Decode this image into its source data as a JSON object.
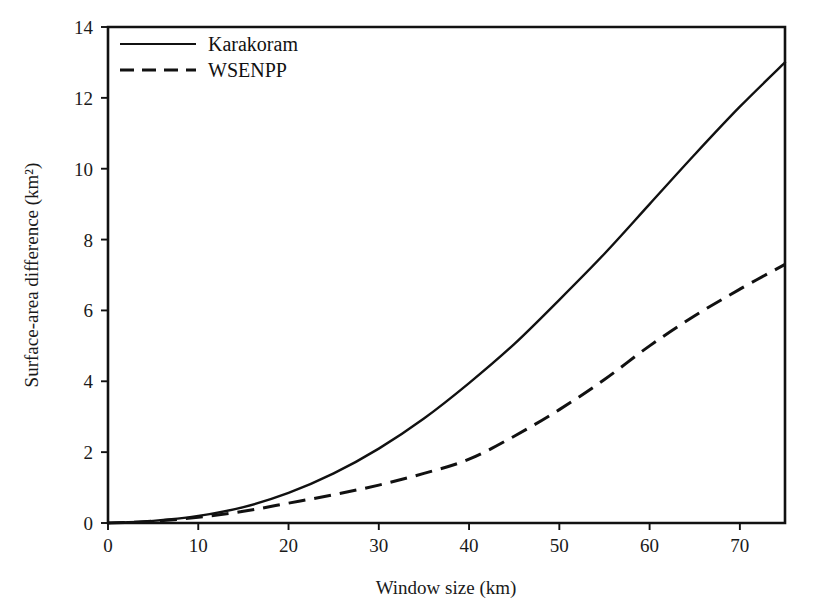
{
  "chart_data": {
    "type": "line",
    "title": "",
    "xlabel": "Window size (km)",
    "ylabel": "Surface-area difference (km²)",
    "xlim": [
      0,
      75
    ],
    "ylim": [
      0,
      14
    ],
    "xticks": [
      0,
      10,
      20,
      30,
      40,
      50,
      60,
      70
    ],
    "xtick_labels": [
      "0",
      "10",
      "20",
      "30",
      "40",
      "50",
      "60",
      "70"
    ],
    "yticks": [
      0,
      2,
      4,
      6,
      8,
      10,
      12,
      14
    ],
    "ytick_labels": [
      "0",
      "2",
      "4",
      "6",
      "8",
      "10",
      "12",
      "14"
    ],
    "grid": false,
    "legend_position": "upper left inside",
    "x": [
      0,
      5,
      10,
      15,
      20,
      25,
      30,
      35,
      40,
      45,
      50,
      55,
      60,
      65,
      70,
      75
    ],
    "series": [
      {
        "name": "Karakoram",
        "style": "solid",
        "color": "#111111",
        "values": [
          0.0,
          0.06,
          0.2,
          0.45,
          0.85,
          1.4,
          2.1,
          2.95,
          3.95,
          5.05,
          6.3,
          7.6,
          9.0,
          10.4,
          11.75,
          13.0
        ]
      },
      {
        "name": "WSENPP",
        "style": "dashed",
        "color": "#111111",
        "values": [
          0.0,
          0.05,
          0.16,
          0.33,
          0.56,
          0.8,
          1.07,
          1.4,
          1.8,
          2.45,
          3.2,
          4.05,
          5.0,
          5.85,
          6.6,
          7.3
        ]
      }
    ]
  },
  "legend": {
    "entries": [
      {
        "label": "Karakoram"
      },
      {
        "label": "WSENPP"
      }
    ]
  }
}
